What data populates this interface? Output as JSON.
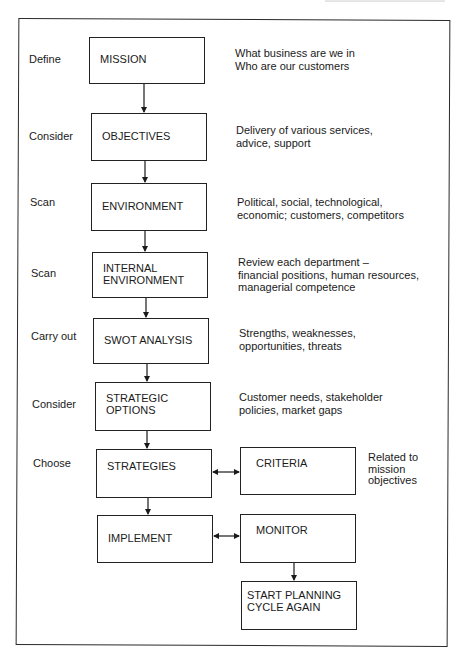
{
  "diagram": {
    "type": "flowchart",
    "steps": [
      {
        "label": "Define",
        "box": "MISSION",
        "description": "What business are we in\nWho are our customers"
      },
      {
        "label": "Consider",
        "box": "OBJECTIVES",
        "description": "Delivery of various services,\nadvice, support"
      },
      {
        "label": "Scan",
        "box": "ENVIRONMENT",
        "description": "Political, social, technological,\neconomic; customers, competitors"
      },
      {
        "label": "Scan",
        "box": "INTERNAL\nENVIRONMENT",
        "description": "Review each department –\nfinancial positions, human resources,\nmanagerial competence"
      },
      {
        "label": "Carry out",
        "box": "SWOT ANALYSIS",
        "description": "Strengths, weaknesses,\nopportunities, threats"
      },
      {
        "label": "Consider",
        "box": "STRATEGIC\nOPTIONS",
        "description": "Customer needs, stakeholder\npolicies, market gaps"
      },
      {
        "label": "Choose",
        "box": "STRATEGIES",
        "description": ""
      },
      {
        "label": "",
        "box": "IMPLEMENT",
        "description": ""
      }
    ],
    "side_boxes": {
      "criteria": {
        "box": "CRITERIA",
        "description": "Related to\nmission\nobjectives"
      },
      "monitor": {
        "box": "MONITOR"
      },
      "restart": {
        "box": "START PLANNING\nCYCLE AGAIN"
      }
    },
    "connections": [
      {
        "from": "MISSION",
        "to": "OBJECTIVES",
        "type": "arrow"
      },
      {
        "from": "OBJECTIVES",
        "to": "ENVIRONMENT",
        "type": "arrow"
      },
      {
        "from": "ENVIRONMENT",
        "to": "INTERNAL ENVIRONMENT",
        "type": "arrow"
      },
      {
        "from": "INTERNAL ENVIRONMENT",
        "to": "SWOT ANALYSIS",
        "type": "arrow"
      },
      {
        "from": "SWOT ANALYSIS",
        "to": "STRATEGIC OPTIONS",
        "type": "arrow"
      },
      {
        "from": "STRATEGIC OPTIONS",
        "to": "STRATEGIES",
        "type": "arrow"
      },
      {
        "from": "STRATEGIES",
        "to": "IMPLEMENT",
        "type": "arrow"
      },
      {
        "from": "STRATEGIES",
        "to": "CRITERIA",
        "type": "bidirectional"
      },
      {
        "from": "IMPLEMENT",
        "to": "MONITOR",
        "type": "bidirectional"
      },
      {
        "from": "MONITOR",
        "to": "START PLANNING CYCLE AGAIN",
        "type": "arrow"
      }
    ]
  }
}
